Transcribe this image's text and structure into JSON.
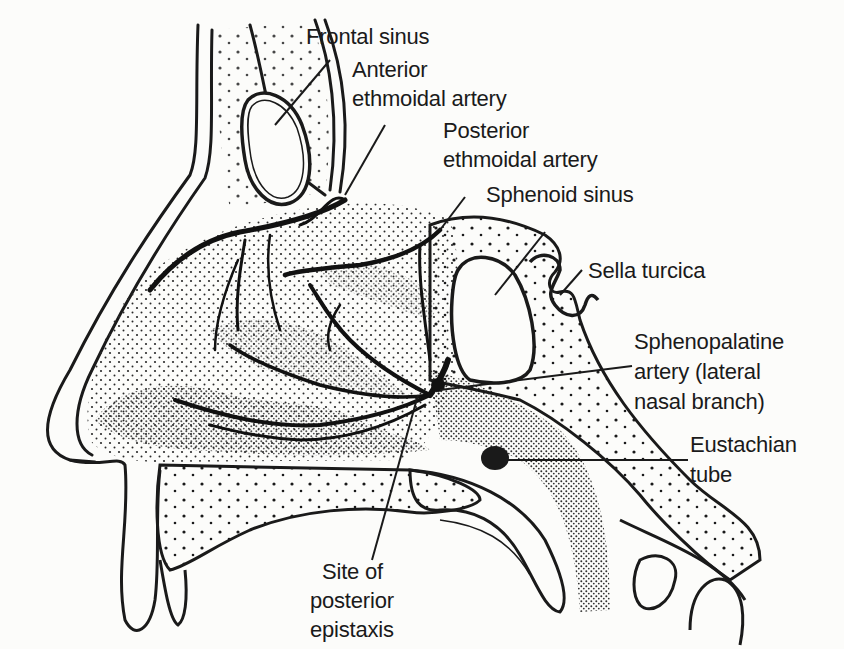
{
  "figure": {
    "colors": {
      "ink": "#1a1a1a",
      "paper": "#fcfcfa",
      "stipple": "#2a2a2a"
    }
  },
  "labels": {
    "frontal_sinus": "Frontal sinus",
    "anterior_ethmoidal_line1": "Anterior",
    "anterior_ethmoidal_line2": "ethmoidal artery",
    "posterior_ethmoidal_line1": "Posterior",
    "posterior_ethmoidal_line2": "ethmoidal artery",
    "sphenoid_sinus": "Sphenoid sinus",
    "sella_turcica": "Sella turcica",
    "sphenopalatine_line1": "Sphenopalatine",
    "sphenopalatine_line2": "artery (lateral",
    "sphenopalatine_line3": "nasal branch)",
    "eustachian_line1": "Eustachian",
    "eustachian_line2": "tube",
    "epistaxis_line1": "Site of",
    "epistaxis_line2": "posterior",
    "epistaxis_line3": "epistaxis"
  }
}
